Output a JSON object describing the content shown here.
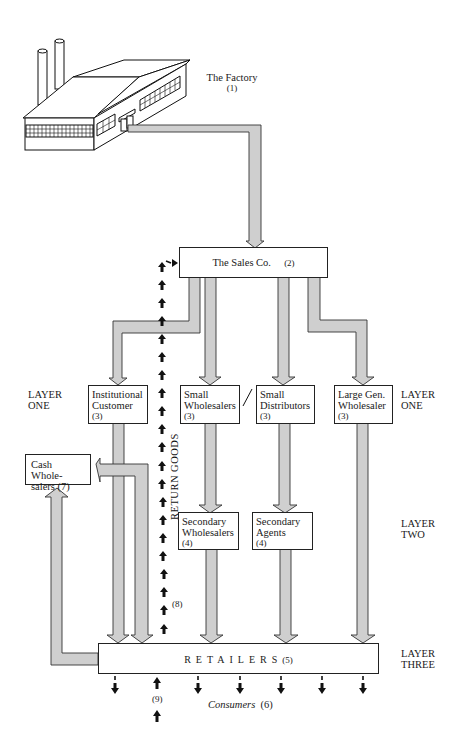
{
  "diagram": {
    "type": "distribution-channel-flow",
    "nodes": {
      "factory": {
        "label": "The Factory",
        "num": "(1)"
      },
      "sales_co": {
        "label": "The Sales Co.",
        "num": "(2)"
      },
      "institutional": {
        "line1": "Institutional",
        "line2": "Customer",
        "num": "(3)"
      },
      "small_wholesalers": {
        "line1": "Small",
        "line2": "Wholesalers",
        "num": "(3)"
      },
      "small_distributors": {
        "line1": "Small",
        "line2": "Distributors",
        "num": "(3)"
      },
      "large_wholesaler": {
        "line1": "Large Gen.",
        "line2": "Wholesaler",
        "num": "(3)"
      },
      "cash_wholesalers": {
        "line1": "Cash Whole-",
        "line2": "salers (7)"
      },
      "secondary_wholesalers": {
        "line1": "Secondary",
        "line2": "Wholesalers",
        "num": "(4)"
      },
      "secondary_agents": {
        "line1": "Secondary",
        "line2": "Agents",
        "num": "(4)"
      },
      "retailers": {
        "label": "RETAILERS",
        "num": "(5)"
      },
      "consumers": {
        "label": "Consumers",
        "num": "(6)"
      }
    },
    "layers": {
      "one_left": {
        "line1": "LAYER",
        "line2": "ONE"
      },
      "one_right": {
        "line1": "LAYER",
        "line2": "ONE"
      },
      "two": {
        "line1": "LAYER",
        "line2": "TWO"
      },
      "three": {
        "line1": "LAYER",
        "line2": "THREE"
      }
    },
    "annotations": {
      "return_goods": "RETURN GOODS",
      "return_num": "(8)",
      "consumer_return_num": "(9)",
      "divider": "/"
    },
    "colors": {
      "arrow_fill": "#cfcfcf",
      "stroke": "#222222"
    }
  }
}
